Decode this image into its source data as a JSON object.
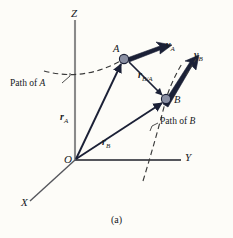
{
  "figure": {
    "caption": "(a)",
    "background_color": "#fdfcf8",
    "axes": {
      "z_label": "Z",
      "y_label": "Y",
      "x_label": "X",
      "origin_label": "O",
      "axis_color": "#8a8a8a"
    },
    "points": [
      {
        "id": "A",
        "label": "A",
        "x": 124,
        "y": 59,
        "marker_color": "#8a8fa3",
        "marker_stroke": "#1b2036"
      },
      {
        "id": "B",
        "label": "B",
        "x": 166,
        "y": 99,
        "marker_color": "#8a8fa3",
        "marker_stroke": "#1b2036"
      }
    ],
    "vectors": [
      {
        "name": "r_A",
        "label_main": "r",
        "label_sub": "A",
        "label_x": 60,
        "label_y": 112,
        "from": "O",
        "to": "A",
        "color": "#1b2036"
      },
      {
        "name": "r_B",
        "label_main": "r",
        "label_sub": "B",
        "label_x": 102,
        "label_y": 137,
        "from": "O",
        "to": "B",
        "color": "#1b2036"
      },
      {
        "name": "r_B/A",
        "label_main": "r",
        "label_sub": "B/A",
        "label_x": 138,
        "label_y": 70,
        "from": "A",
        "to": "B",
        "color": "#1b2036"
      },
      {
        "name": "v_A",
        "label_main": "v",
        "label_sub": "A",
        "label_x": 167,
        "label_y": 43,
        "from": "A",
        "to": "velocity-A",
        "color": "#1b2036"
      },
      {
        "name": "v_B",
        "label_main": "v",
        "label_sub": "B",
        "label_x": 196,
        "label_y": 55,
        "from": "B",
        "to": "velocity-B",
        "color": "#1b2036"
      }
    ],
    "paths": [
      {
        "name": "path-of-A",
        "label_prefix": "Path of ",
        "label_point": "A",
        "label_x": 12,
        "label_y": 84,
        "style": "dashed",
        "color": "#3a3a3a"
      },
      {
        "name": "path-of-B",
        "label_prefix": "Path of ",
        "label_point": "B",
        "label_x": 160,
        "label_y": 121,
        "style": "dashed",
        "color": "#3a3a3a"
      }
    ]
  }
}
